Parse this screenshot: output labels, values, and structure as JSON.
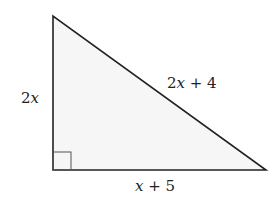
{
  "diagram": {
    "type": "right-triangle",
    "fill_color": "#f6f6f6",
    "stroke_color": "#222222",
    "vertices": {
      "top": [
        53,
        16
      ],
      "right_angle": [
        53,
        170
      ],
      "right": [
        266,
        170
      ]
    },
    "right_angle_marker": true,
    "labels": {
      "vertical_leg": {
        "var": "2",
        "x": "x",
        "text": "2x"
      },
      "hypotenuse": {
        "coef": "2",
        "x": "x",
        "rest": " + 4",
        "text": "2x + 4"
      },
      "horizontal_leg": {
        "x": "x",
        "rest": " + 5",
        "text": "x + 5"
      }
    }
  }
}
